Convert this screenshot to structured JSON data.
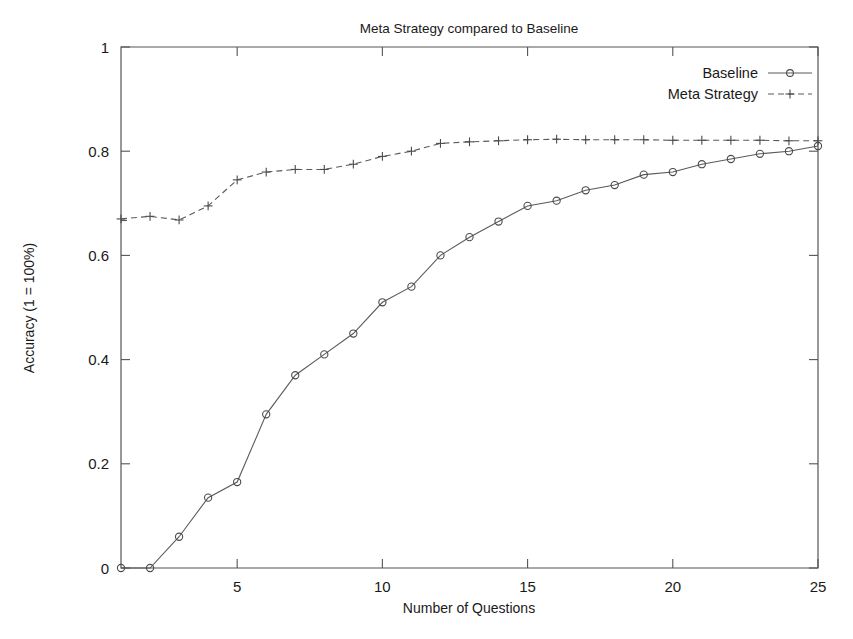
{
  "chart_data": {
    "type": "line",
    "title": "Meta Strategy compared to Baseline",
    "xlabel": "Number of Questions",
    "ylabel": "Accuracy (1 = 100%)",
    "xlim": [
      1,
      25
    ],
    "ylim": [
      0,
      1
    ],
    "grid": false,
    "legend_position": "top-right",
    "x": [
      1,
      2,
      3,
      4,
      5,
      6,
      7,
      8,
      9,
      10,
      11,
      12,
      13,
      14,
      15,
      16,
      17,
      18,
      19,
      20,
      21,
      22,
      23,
      24,
      25
    ],
    "xticks": [
      5,
      10,
      15,
      20,
      25
    ],
    "xtick_labels": [
      "5",
      "10",
      "15",
      "20",
      "25"
    ],
    "yticks": [
      0,
      0.2,
      0.4,
      0.6,
      0.8,
      1
    ],
    "ytick_labels": [
      "0",
      "0.2",
      "0.4",
      "0.6",
      "0.8",
      "1"
    ],
    "series": [
      {
        "name": "Baseline",
        "marker": "circle",
        "linestyle": "solid",
        "color": "#5a5a5a",
        "values": [
          0.0,
          0.0,
          0.06,
          0.135,
          0.165,
          0.295,
          0.37,
          0.41,
          0.45,
          0.51,
          0.54,
          0.6,
          0.635,
          0.665,
          0.695,
          0.705,
          0.725,
          0.735,
          0.755,
          0.76,
          0.775,
          0.785,
          0.795,
          0.8,
          0.81
        ]
      },
      {
        "name": "Meta Strategy",
        "marker": "plus",
        "linestyle": "dashed",
        "color": "#5a5a5a",
        "values": [
          0.67,
          0.675,
          0.668,
          0.695,
          0.745,
          0.76,
          0.765,
          0.765,
          0.775,
          0.79,
          0.8,
          0.815,
          0.818,
          0.82,
          0.822,
          0.823,
          0.822,
          0.822,
          0.822,
          0.821,
          0.821,
          0.821,
          0.821,
          0.82,
          0.82
        ]
      }
    ]
  },
  "legend": {
    "entries": [
      {
        "label": "Baseline"
      },
      {
        "label": "Meta Strategy"
      }
    ]
  },
  "colors": {
    "axis": "#555555",
    "series": "#5a5a5a",
    "background": "#ffffff"
  }
}
